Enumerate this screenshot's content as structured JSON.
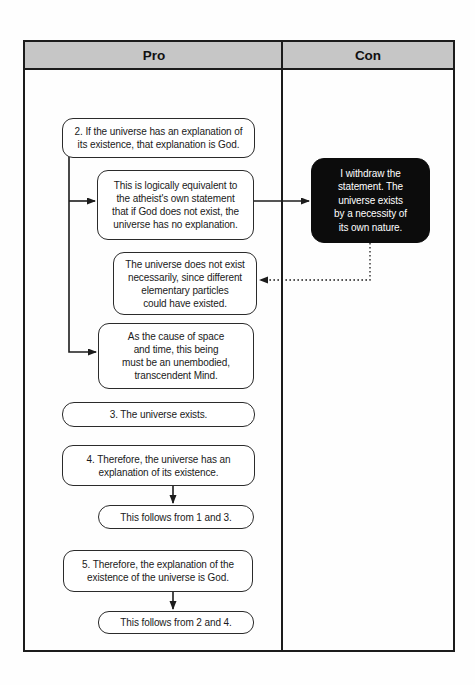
{
  "table": {
    "header": {
      "pro_label": "Pro",
      "con_label": "Con"
    }
  },
  "pro_column": {
    "premise_2": "2. If the universe has an explanation of\nits existence, that explanation is God.",
    "equivalence_note": "This is logically equivalent to\nthe atheist's own statement\nthat if God does not exist, the\nuniverse has no explanation.",
    "not_necessary_note": "The universe does not exist\nnecessarily, since different\nelementary particles\ncould have existed.",
    "cause_mind_note": "As the cause of space\nand time, this being\nmust be an unembodied,\ntranscendent Mind.",
    "premise_3": "3. The universe exists.",
    "premise_4": "4. Therefore, the universe has an\nexplanation of its existence.",
    "follows_from_1_and_3": "This follows from 1 and 3.",
    "premise_5": "5. Therefore, the explanation of the\nexistence of the universe is God.",
    "follows_from_2_and_4": "This follows from 2 and 4."
  },
  "con_column": {
    "withdraw_statement": "I withdraw the\nstatement. The\nuniverse exists\nby a necessity of\nits own nature."
  },
  "colors": {
    "line": "#1c1c1c",
    "header_bg": "#c6c6c6",
    "box_border": "#2b2b2b",
    "con_box_bg": "#0c0c0c",
    "con_box_text": "#ffffff"
  }
}
